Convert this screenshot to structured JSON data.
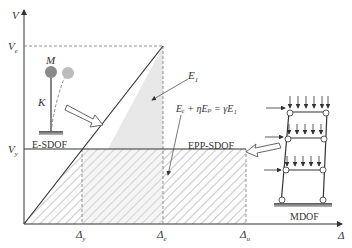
{
  "axes": {
    "y_label": "V",
    "x_label": "Δ",
    "y_ticks": [
      {
        "label": "V",
        "sub": "e"
      },
      {
        "label": "V",
        "sub": "y"
      }
    ],
    "x_ticks": [
      {
        "label": "Δ",
        "sub": "y"
      },
      {
        "label": "Δ",
        "sub": "e"
      },
      {
        "label": "Δ",
        "sub": "u"
      }
    ]
  },
  "labels": {
    "energy_elastic": "E",
    "energy_elastic_sub": "1",
    "equation": "Eₑ + ηEₚ = γE₁",
    "epp_sdof": "EPP-SDOF",
    "e_sdof": "E-SDOF",
    "mdof": "MDOF",
    "mass": "M",
    "stiffness": "K"
  },
  "colors": {
    "line": "#333333",
    "shade_elastic": "#e6e6e6",
    "hatch": "#b8b8b8",
    "mass_solid": "#8a8a8a",
    "mass_ghost": "#bcbcbc"
  }
}
